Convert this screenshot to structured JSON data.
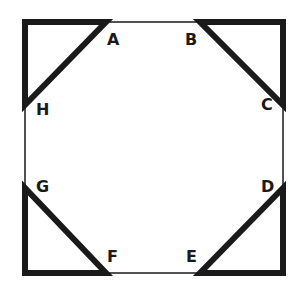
{
  "diagram": {
    "stroke_color": "#1a1a1a",
    "labels": {
      "A": "A",
      "B": "B",
      "C": "C",
      "D": "D",
      "E": "E",
      "F": "F",
      "G": "G",
      "H": "H"
    },
    "points": {
      "A": [
        106,
        22
      ],
      "B": [
        200,
        22
      ],
      "C": [
        283,
        105
      ],
      "D": [
        283,
        188
      ],
      "E": [
        200,
        273
      ],
      "F": [
        106,
        273
      ],
      "G": [
        25,
        188
      ],
      "H": [
        25,
        105
      ]
    }
  }
}
